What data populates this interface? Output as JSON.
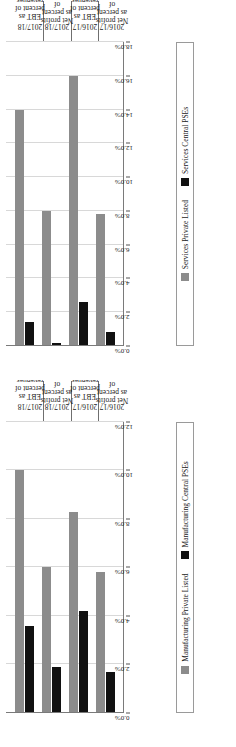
{
  "page": {
    "background": "#ffffff",
    "orientation": "rotated-90"
  },
  "colors": {
    "series_listed": "#8c8c8c",
    "series_pse": "#111111",
    "gridline": "#d8d8d8",
    "axis": "#7a7a7a"
  },
  "charts": [
    {
      "id": "services",
      "legend": [
        {
          "label": "Services Private Listed",
          "color": "#8c8c8c",
          "swatch": "square-swatch"
        },
        {
          "label": "Services Central PSEs",
          "color": "#111111",
          "swatch": "square-swatch"
        }
      ],
      "chart_data": {
        "type": "bar",
        "orientation": "vertical-rotated",
        "title": "",
        "xlabel": "",
        "ylabel": "",
        "ylim": [
          0,
          18
        ],
        "ytick_labels": [
          "0.0%",
          "2.0%",
          "4.0%",
          "6.0%",
          "8.0%",
          "10.0%",
          "12.0%",
          "14.0%",
          "16.0%",
          "18.0%"
        ],
        "ytick_values": [
          0,
          2,
          4,
          6,
          8,
          10,
          12,
          14,
          16,
          18
        ],
        "grid": true,
        "legend_position": "bottom",
        "categories": [
          {
            "year": "2017/18",
            "measure": "EBT as percent of revenues"
          },
          {
            "year": "2017/18",
            "measure": "Net profits as percent of revenues"
          },
          {
            "year": "2016/17",
            "measure": "EBT as percent of revenues"
          },
          {
            "year": "2016/17",
            "measure": "Net profits as percent of revenues"
          }
        ],
        "series": [
          {
            "name": "Services Private Listed",
            "color": "#8c8c8c",
            "values": [
              14.0,
              8.0,
              16.0,
              7.8
            ]
          },
          {
            "name": "Services Central PSEs",
            "color": "#111111",
            "values": [
              1.4,
              0.2,
              2.6,
              0.8
            ]
          }
        ]
      }
    },
    {
      "id": "manufacturing",
      "legend": [
        {
          "label": "Manufacturing Private Listed",
          "color": "#8c8c8c",
          "swatch": "square-swatch"
        },
        {
          "label": "Manufacturing Central PSEs",
          "color": "#111111",
          "swatch": "square-swatch"
        }
      ],
      "chart_data": {
        "type": "bar",
        "orientation": "vertical-rotated",
        "title": "",
        "xlabel": "",
        "ylabel": "",
        "ylim": [
          0,
          12
        ],
        "ytick_labels": [
          "0.0%",
          "2.0%",
          "4.0%",
          "6.0%",
          "8.0%",
          "10.0%",
          "12.0%"
        ],
        "ytick_values": [
          0,
          2,
          4,
          6,
          8,
          10,
          12
        ],
        "grid": true,
        "legend_position": "bottom",
        "categories": [
          {
            "year": "2017/18",
            "measure": "EBT as percent of revenues"
          },
          {
            "year": "2017/18",
            "measure": "Net profits as percent of revenues"
          },
          {
            "year": "2016/17",
            "measure": "EBT as percent of revenues"
          },
          {
            "year": "2016/17",
            "measure": "Net profits as percent of revenues"
          }
        ],
        "series": [
          {
            "name": "Manufacturing Private Listed",
            "color": "#8c8c8c",
            "values": [
              10.0,
              6.0,
              8.3,
              5.8
            ]
          },
          {
            "name": "Manufacturing Central PSEs",
            "color": "#111111",
            "values": [
              3.6,
              1.9,
              4.2,
              1.7
            ]
          }
        ]
      }
    }
  ]
}
